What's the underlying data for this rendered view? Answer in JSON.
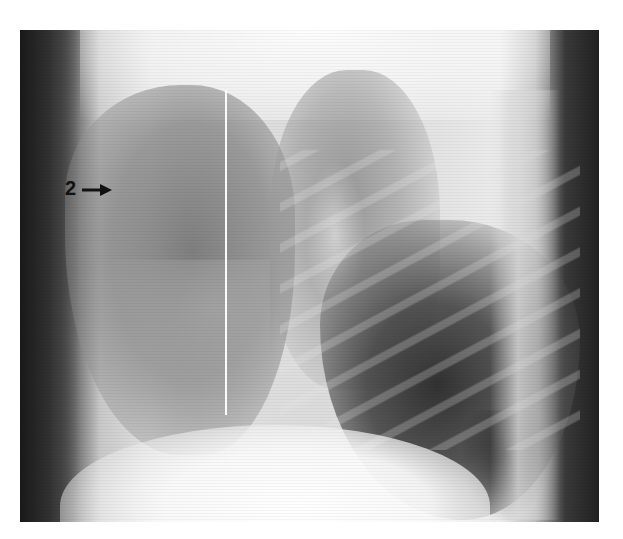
{
  "image": {
    "type": "lateral chest radiograph",
    "colors": {
      "background": "#ffffff",
      "annotation": "#111111",
      "marker_line": "#ffffff"
    }
  },
  "annotations": [
    {
      "label": "2",
      "icon": "arrow-right-icon",
      "points_to": "anterior lung opacity"
    }
  ]
}
